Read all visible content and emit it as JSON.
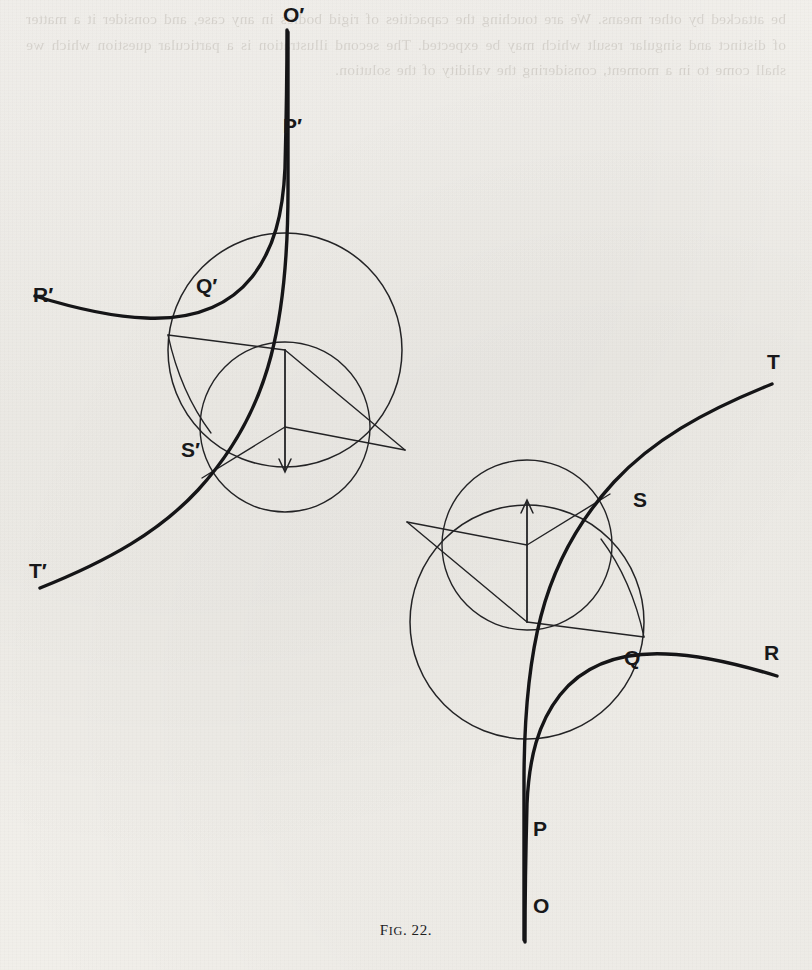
{
  "page": {
    "background_color": "#f1efea",
    "ink_color": "#1b1b1d",
    "bleed_through_text": "be attacked by other means. We are touching the capacities of rigid bodies in any case, and consider it a matter of distinct and singular result which may be expected. The second illustration is a particular question which we shall come to in a moment, considering the validity of the solution."
  },
  "figure": {
    "caption_prefix": "F",
    "caption_smallcaps": "IG",
    "caption_suffix": ". 22.",
    "caption_full": "FIG. 22.",
    "labels": [
      {
        "name": "label-o-prime",
        "text": "O′",
        "x": 283,
        "y": 22
      },
      {
        "name": "label-p-prime",
        "text": "P′",
        "x": 283,
        "y": 133
      },
      {
        "name": "label-q-prime",
        "text": "Q′",
        "x": 196,
        "y": 293
      },
      {
        "name": "label-r-prime",
        "text": "R′",
        "x": 33,
        "y": 302
      },
      {
        "name": "label-s-prime",
        "text": "S′",
        "x": 181,
        "y": 457
      },
      {
        "name": "label-t-prime",
        "text": "T′",
        "x": 29,
        "y": 578
      },
      {
        "name": "label-t",
        "text": "T",
        "x": 767,
        "y": 369
      },
      {
        "name": "label-s",
        "text": "S",
        "x": 633,
        "y": 507
      },
      {
        "name": "label-r",
        "text": "R",
        "x": 764,
        "y": 660
      },
      {
        "name": "label-q",
        "text": "Q",
        "x": 624,
        "y": 665
      },
      {
        "name": "label-p",
        "text": "P",
        "x": 533,
        "y": 836
      },
      {
        "name": "label-o",
        "text": "O",
        "x": 533,
        "y": 913
      }
    ],
    "geometry": {
      "upper": {
        "outer_circle": {
          "cx": 285,
          "cy": 350,
          "r": 117
        },
        "inner_circle": {
          "cx": 285,
          "cy": 427,
          "r": 85
        },
        "hub_upper": {
          "x": 285,
          "y": 350
        },
        "hub_lower": {
          "x": 285,
          "y": 427
        },
        "cusp": {
          "x": 405,
          "y": 450
        }
      },
      "lower": {
        "outer_circle": {
          "cx": 527,
          "cy": 622,
          "r": 117
        },
        "inner_circle": {
          "cx": 527,
          "cy": 545,
          "r": 85
        },
        "hub_lower": {
          "x": 527,
          "y": 622
        },
        "hub_upper": {
          "x": 527,
          "y": 545
        },
        "cusp": {
          "x": 407,
          "y": 522
        }
      },
      "arrow_down": {
        "x": 285,
        "y1": 350,
        "y2": 470
      },
      "arrow_up": {
        "x": 527,
        "y1": 622,
        "y2": 502
      }
    }
  }
}
